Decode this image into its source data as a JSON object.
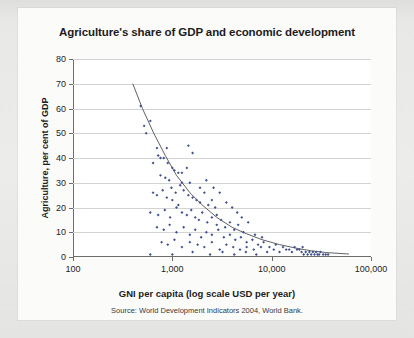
{
  "figure": {
    "title": "Agriculture's share of GDP and economic development",
    "source": "Source: World Development Indicators 2004, World Bank."
  },
  "chart_data": {
    "type": "scatter",
    "title": "Agriculture's share of GDP and economic development",
    "xlabel": "GNI per capita (log scale USD per year)",
    "ylabel": "Agriculture, per cent of GDP",
    "source": "Source: World Development Indicators 2004, World Bank.",
    "xscale": "log",
    "xlim": [
      100,
      100000
    ],
    "ylim": [
      0,
      80
    ],
    "xticks": [
      100,
      1000,
      10000,
      100000
    ],
    "xticklabels": [
      "100",
      "1,000",
      "10,000",
      "100,000"
    ],
    "yticks": [
      0,
      10,
      20,
      30,
      40,
      50,
      60,
      70,
      80
    ],
    "yticklabels": [
      "0",
      "10",
      "20",
      "30",
      "40",
      "50",
      "60",
      "70",
      "80"
    ],
    "grid": "horizontal",
    "legend": "none",
    "marker_color": "#43528f",
    "trend_color": "#4f4f4f",
    "series": [
      {
        "name": "Countries",
        "marker": "diamond",
        "points": [
          [
            480,
            61
          ],
          [
            520,
            53
          ],
          [
            545,
            50
          ],
          [
            600,
            55
          ],
          [
            700,
            44
          ],
          [
            720,
            41
          ],
          [
            760,
            40
          ],
          [
            640,
            38
          ],
          [
            820,
            40
          ],
          [
            900,
            38
          ],
          [
            1000,
            36
          ],
          [
            1050,
            35
          ],
          [
            1150,
            34
          ],
          [
            760,
            33
          ],
          [
            850,
            32
          ],
          [
            930,
            31
          ],
          [
            1250,
            34
          ],
          [
            1400,
            36
          ],
          [
            1500,
            30
          ],
          [
            640,
            26
          ],
          [
            700,
            25
          ],
          [
            800,
            27
          ],
          [
            880,
            24
          ],
          [
            980,
            28
          ],
          [
            1080,
            26
          ],
          [
            1200,
            29
          ],
          [
            1300,
            27
          ],
          [
            1450,
            25
          ],
          [
            1600,
            24
          ],
          [
            1750,
            23
          ],
          [
            1900,
            22
          ],
          [
            2100,
            26
          ],
          [
            2300,
            21
          ],
          [
            2500,
            23
          ],
          [
            2700,
            20
          ],
          [
            600,
            18
          ],
          [
            720,
            17
          ],
          [
            840,
            19
          ],
          [
            950,
            16
          ],
          [
            1100,
            20
          ],
          [
            1250,
            18
          ],
          [
            1400,
            17
          ],
          [
            1550,
            19
          ],
          [
            1700,
            16
          ],
          [
            1850,
            15
          ],
          [
            2000,
            18
          ],
          [
            2250,
            14
          ],
          [
            2500,
            16
          ],
          [
            2800,
            13
          ],
          [
            3100,
            15
          ],
          [
            3400,
            12
          ],
          [
            3800,
            14
          ],
          [
            4200,
            11
          ],
          [
            4600,
            13
          ],
          [
            5200,
            10
          ],
          [
            700,
            12
          ],
          [
            820,
            11
          ],
          [
            940,
            13
          ],
          [
            1100,
            10
          ],
          [
            1300,
            12
          ],
          [
            1500,
            9
          ],
          [
            1700,
            11
          ],
          [
            1950,
            8
          ],
          [
            2200,
            10
          ],
          [
            2500,
            9
          ],
          [
            2900,
            11
          ],
          [
            3300,
            8
          ],
          [
            3800,
            9
          ],
          [
            4300,
            7
          ],
          [
            4900,
            8
          ],
          [
            5600,
            6
          ],
          [
            6400,
            7
          ],
          [
            7300,
            5
          ],
          [
            8300,
            6
          ],
          [
            9500,
            4
          ],
          [
            780,
            6
          ],
          [
            900,
            5
          ],
          [
            1050,
            7
          ],
          [
            1250,
            4
          ],
          [
            1500,
            6
          ],
          [
            1800,
            5
          ],
          [
            2100,
            4
          ],
          [
            2500,
            6
          ],
          [
            3000,
            3
          ],
          [
            3500,
            5
          ],
          [
            4100,
            4
          ],
          [
            4800,
            3
          ],
          [
            5600,
            4
          ],
          [
            6600,
            3
          ],
          [
            7800,
            4
          ],
          [
            9000,
            2
          ],
          [
            10500,
            3
          ],
          [
            12000,
            2
          ],
          [
            14000,
            3
          ],
          [
            16000,
            2
          ],
          [
            18000,
            3
          ],
          [
            20000,
            2
          ],
          [
            21000,
            1
          ],
          [
            22000,
            2
          ],
          [
            23000,
            1
          ],
          [
            24000,
            2
          ],
          [
            25000,
            1
          ],
          [
            26000,
            2
          ],
          [
            27000,
            1
          ],
          [
            28000,
            2
          ],
          [
            29000,
            1
          ],
          [
            30000,
            1
          ],
          [
            31000,
            2
          ],
          [
            33000,
            1
          ],
          [
            35000,
            1
          ],
          [
            37000,
            1
          ],
          [
            600,
            1
          ],
          [
            1000,
            1
          ],
          [
            1600,
            2
          ],
          [
            2400,
            1
          ],
          [
            3200,
            2
          ],
          [
            4200,
            1
          ],
          [
            5500,
            2
          ],
          [
            7000,
            1
          ],
          [
            1450,
            45
          ],
          [
            1600,
            42
          ],
          [
            1250,
            30
          ],
          [
            1900,
            28
          ],
          [
            2200,
            31
          ],
          [
            2600,
            28
          ],
          [
            3000,
            26
          ],
          [
            3500,
            22
          ],
          [
            4000,
            20
          ],
          [
            4500,
            18
          ],
          [
            5000,
            16
          ],
          [
            5800,
            14
          ],
          [
            880,
            44
          ],
          [
            1000,
            23
          ],
          [
            1150,
            21
          ],
          [
            2800,
            17
          ],
          [
            6800,
            9
          ],
          [
            8000,
            8
          ],
          [
            11000,
            5
          ],
          [
            13000,
            4
          ],
          [
            15000,
            3
          ],
          [
            17000,
            4
          ],
          [
            19000,
            3
          ],
          [
            20500,
            4
          ]
        ]
      }
    ],
    "trendline": {
      "name": "fitted curve",
      "points": [
        [
          400,
          70
        ],
        [
          500,
          60
        ],
        [
          650,
          50
        ],
        [
          850,
          41
        ],
        [
          1100,
          33
        ],
        [
          1500,
          26
        ],
        [
          2000,
          21
        ],
        [
          2800,
          16
        ],
        [
          4000,
          12
        ],
        [
          5500,
          9.5
        ],
        [
          8000,
          7
        ],
        [
          12000,
          5
        ],
        [
          18000,
          3.5
        ],
        [
          25000,
          2.5
        ],
        [
          35000,
          1.8
        ],
        [
          50000,
          1.4
        ],
        [
          60000,
          1.2
        ]
      ]
    }
  }
}
